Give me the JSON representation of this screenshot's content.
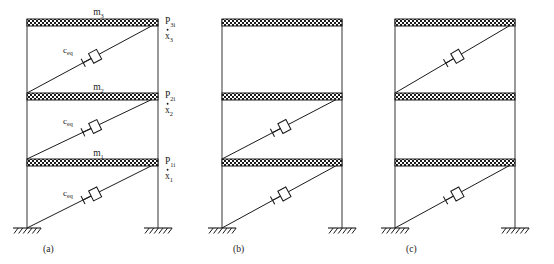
{
  "figure": {
    "line_color": "#1a1a1a",
    "slab_fill": "#c8c8c8",
    "column_color": "#6e6e6e",
    "panels": [
      {
        "id": "a",
        "caption": "(a)",
        "damper_stories": [
          1,
          2,
          3
        ],
        "mass_labels": [
          {
            "base": "m",
            "sub": "1"
          },
          {
            "base": "m",
            "sub": "2"
          },
          {
            "base": "m",
            "sub": "3"
          }
        ],
        "damper_labels": [
          {
            "base": "c",
            "sub": "eq"
          },
          {
            "base": "c",
            "sub": "eq"
          },
          {
            "base": "c",
            "sub": "eq"
          }
        ],
        "force_labels": [
          {
            "base": "P",
            "sub": "1i"
          },
          {
            "base": "P",
            "sub": "2i"
          },
          {
            "base": "P",
            "sub": "3i"
          }
        ],
        "velocity_labels": [
          {
            "base": "x",
            "sub": "1"
          },
          {
            "base": "x",
            "sub": "2"
          },
          {
            "base": "x",
            "sub": "3"
          }
        ]
      },
      {
        "id": "b",
        "caption": "(b)",
        "damper_stories": [
          1,
          2
        ],
        "mass_labels": [],
        "damper_labels": [],
        "force_labels": [],
        "velocity_labels": []
      },
      {
        "id": "c",
        "caption": "(c)",
        "damper_stories": [
          1,
          3
        ],
        "mass_labels": [],
        "damper_labels": [],
        "force_labels": [],
        "velocity_labels": []
      }
    ]
  }
}
